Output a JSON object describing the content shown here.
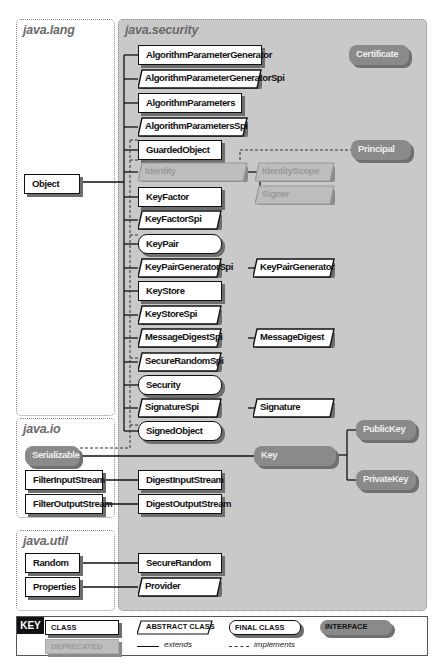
{
  "packages": {
    "java_lang": "java.lang",
    "java_security": "java.security",
    "java_io": "java.io",
    "java_util": "java.util"
  },
  "java_lang": {
    "object": "Object"
  },
  "java_security": {
    "classes": [
      {
        "name": "AlgorithmParameterGenerator",
        "kind": "class"
      },
      {
        "name": "AlgorithmParameterGeneratorSpi",
        "kind": "abstract"
      },
      {
        "name": "AlgorithmParameters",
        "kind": "class"
      },
      {
        "name": "AlgorithmParametersSpi",
        "kind": "abstract"
      },
      {
        "name": "GuardedObject",
        "kind": "class"
      },
      {
        "name": "Identity",
        "kind": "deprecated-abstract"
      },
      {
        "name": "KeyFactor",
        "kind": "class"
      },
      {
        "name": "KeyFactorSpi",
        "kind": "abstract"
      },
      {
        "name": "KeyPair",
        "kind": "final"
      },
      {
        "name": "KeyPairGeneratorSpi",
        "kind": "abstract"
      },
      {
        "name": "KeyStore",
        "kind": "class"
      },
      {
        "name": "KeyStoreSpi",
        "kind": "abstract"
      },
      {
        "name": "MessageDigestSpi",
        "kind": "abstract"
      },
      {
        "name": "SecureRandomSpi",
        "kind": "abstract"
      },
      {
        "name": "Security",
        "kind": "final"
      },
      {
        "name": "SignatureSpi",
        "kind": "abstract"
      },
      {
        "name": "SignedObject",
        "kind": "final"
      }
    ],
    "subclasses": {
      "identity_scope": "IdentityScope",
      "signer": "Signer",
      "key_pair_generator": "KeyPairGenerator",
      "message_digest": "MessageDigest",
      "signature": "Signature",
      "digest_input_stream": "DigestInputStream",
      "digest_output_stream": "DigestOutputStream",
      "secure_random": "SecureRandom",
      "provider": "Provider"
    },
    "interfaces": {
      "certificate": "Certificate",
      "principal": "Principal",
      "key": "Key",
      "public_key": "PublicKey",
      "private_key": "PrivateKey"
    }
  },
  "java_io": {
    "serializable": "Serializable",
    "filter_input_stream": "FilterInputStream",
    "filter_output_stream": "FilterOutputStream"
  },
  "java_util": {
    "random": "Random",
    "properties": "Properties"
  },
  "key": {
    "label": "KEY",
    "class": "CLASS",
    "abstract_class": "ABSTRACT CLASS",
    "final_class": "FINAL CLASS",
    "interface": "INTERFACE",
    "deprecated": "DEPRECATED",
    "extends": "extends",
    "implements": "implements"
  },
  "colors": {
    "security_bg": "#c9c9c9",
    "interface_fill": "#8a8a8a",
    "deprecated_fill": "#bdbdbd",
    "shadow": "#6e6e6e"
  }
}
